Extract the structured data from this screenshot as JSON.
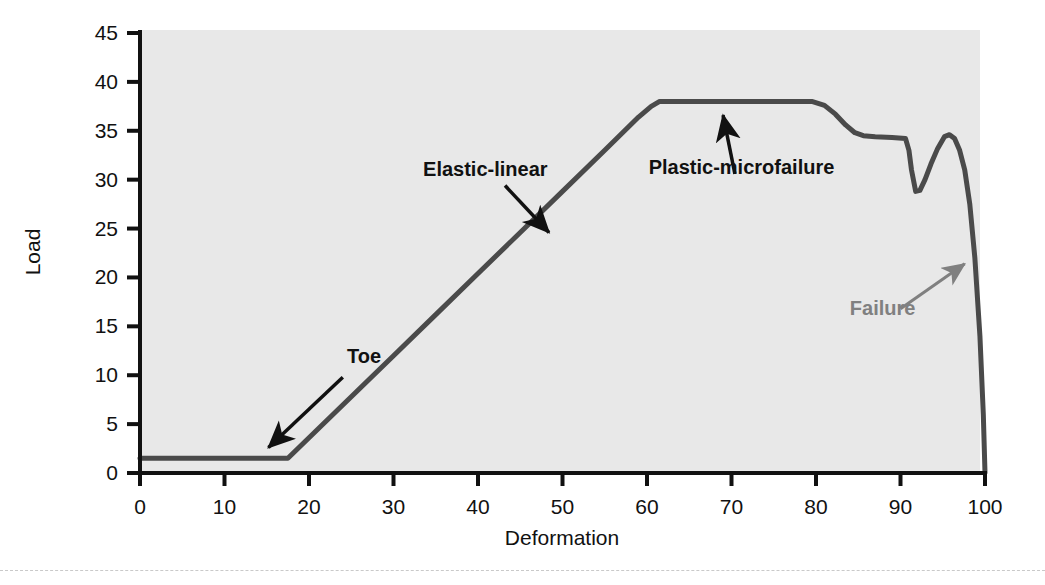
{
  "figure": {
    "background_color": "#ffffff",
    "panel_color": "#e8e8e8",
    "curve_color": "#4a4a4a",
    "axis_color": "#111111",
    "annotation_color": "#111111",
    "failure_annotation_color": "#808080"
  },
  "chart_data": {
    "type": "line",
    "title": "",
    "xlabel": "Deformation",
    "ylabel": "Load",
    "xlim": [
      0,
      100
    ],
    "ylim": [
      0,
      45
    ],
    "grid": false,
    "legend": "none",
    "xticks": [
      0,
      10,
      20,
      30,
      40,
      50,
      60,
      70,
      80,
      90,
      100
    ],
    "xtick_labels": [
      "0",
      "10",
      "20",
      "30",
      "40",
      "50",
      "60",
      "70",
      "80",
      "90",
      "100"
    ],
    "yticks": [
      0,
      5,
      10,
      15,
      20,
      25,
      30,
      35,
      40,
      45
    ],
    "ytick_labels": [
      "0",
      "5",
      "10",
      "15",
      "20",
      "25",
      "30",
      "35",
      "40",
      "45"
    ],
    "series": [
      {
        "name": "load-deformation",
        "x": [
          0,
          5,
          10,
          15,
          17.5,
          20,
          25,
          30,
          35,
          40,
          45,
          50,
          55,
          59,
          60.5,
          61.5,
          63,
          66,
          70,
          75,
          79.5,
          81,
          82.3,
          83.5,
          84.6,
          85.6,
          87,
          89,
          90.6,
          91.0,
          91.3,
          91.8,
          92.3,
          92.9,
          93.6,
          94.4,
          95.2,
          95.8,
          96.4,
          97.0,
          97.6,
          98.2,
          98.8,
          99.4,
          99.8,
          100
        ],
        "y": [
          1.5,
          1.5,
          1.5,
          1.5,
          1.5,
          3.6,
          7.8,
          12.0,
          16.2,
          20.4,
          24.6,
          28.8,
          33.0,
          36.4,
          37.5,
          38.0,
          38.0,
          38.0,
          38.0,
          38.0,
          38.0,
          37.6,
          36.7,
          35.6,
          34.8,
          34.5,
          34.4,
          34.3,
          34.2,
          33.0,
          31.0,
          28.8,
          28.9,
          30.0,
          31.6,
          33.2,
          34.4,
          34.6,
          34.2,
          33.0,
          31.0,
          27.5,
          22.0,
          14.0,
          6.0,
          0
        ]
      }
    ],
    "annotations": [
      {
        "id": "toe",
        "label": "Toe",
        "label_x": 24.5,
        "label_y": 11.2,
        "arrow_from_x": 24.0,
        "arrow_from_y": 9.8,
        "arrow_to_x": 15.2,
        "arrow_to_y": 2.6,
        "color": "#111111"
      },
      {
        "id": "elastic-linear",
        "label": "Elastic-linear",
        "label_x": 33.5,
        "label_y": 30.4,
        "arrow_from_x": 43.2,
        "arrow_from_y": 29.4,
        "arrow_to_x": 48.4,
        "arrow_to_y": 24.6,
        "color": "#111111"
      },
      {
        "id": "plastic-microfailure",
        "label": "Plastic-microfailure",
        "label_x": 60.2,
        "label_y": 30.6,
        "arrow_from_x": 70.4,
        "arrow_from_y": 30.6,
        "arrow_to_x": 69.0,
        "arrow_to_y": 36.6,
        "color": "#111111"
      },
      {
        "id": "failure",
        "label": "Failure",
        "label_x": 84.0,
        "label_y": 16.2,
        "arrow_from_x": 90.0,
        "arrow_from_y": 16.8,
        "arrow_to_x": 97.6,
        "arrow_to_y": 21.4,
        "color": "#808080"
      }
    ]
  }
}
